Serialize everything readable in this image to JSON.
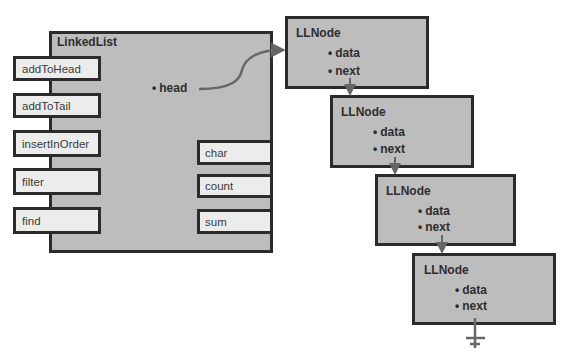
{
  "linked_list": {
    "title": "LinkedList",
    "methods": [
      "addToHead",
      "addToTail",
      "insertInOrder",
      "filter",
      "find"
    ],
    "fields": [
      "char",
      "count",
      "sum"
    ],
    "property": {
      "bullet": "•",
      "label": "head"
    }
  },
  "nodes": [
    {
      "title": "LLNode",
      "properties": [
        {
          "bullet": "•",
          "label": "data"
        },
        {
          "bullet": "•",
          "label": "next"
        }
      ]
    },
    {
      "title": "LLNode",
      "properties": [
        {
          "bullet": "•",
          "label": "data"
        },
        {
          "bullet": "•",
          "label": "next"
        }
      ]
    },
    {
      "title": "LLNode",
      "properties": [
        {
          "bullet": "•",
          "label": "data"
        },
        {
          "bullet": "•",
          "label": "next"
        }
      ]
    },
    {
      "title": "LLNode",
      "properties": [
        {
          "bullet": "•",
          "label": "data"
        },
        {
          "bullet": "•",
          "label": "next"
        }
      ]
    }
  ],
  "connectors": {
    "head_to_node0": "curved-arrow",
    "node_next_links": "vertical-arrow",
    "terminator": "null-ground-symbol"
  },
  "colors": {
    "box_fill": "#bdbdbd",
    "button_fill": "#ececec",
    "border": "#2b2b2b",
    "arrow": "#666666"
  }
}
